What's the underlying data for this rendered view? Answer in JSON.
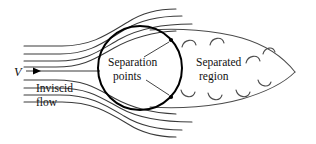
{
  "figure": {
    "width": 316,
    "height": 144,
    "background_color": "#ffffff",
    "line_color": "#3a3a3a",
    "body_color": "#000000",
    "text_color": "#111111"
  },
  "labels": {
    "velocity": "V",
    "inviscid_flow_line1": "Inviscid",
    "inviscid_flow_line2": "flow",
    "separation_points_line1": "Separation",
    "separation_points_line2": "points",
    "separated_region_line1": "Separated",
    "separated_region_line2": "region"
  },
  "diagram_data": {
    "type": "diagram",
    "subject": "fluid-dynamics-flow-separation",
    "body": {
      "shape": "circle",
      "center_x": 140,
      "center_y": 68,
      "radius": 42
    },
    "separation_points": [
      {
        "x": 171,
        "y": 40
      },
      {
        "x": 171,
        "y": 97
      }
    ],
    "wake": {
      "shape": "teardrop",
      "tip_x": 295,
      "tip_y": 72,
      "eddy_count": 8
    },
    "streamlines": {
      "upper_count": 4,
      "lower_count": 4,
      "centerline_count": 1
    },
    "flow_direction": "left-to-right"
  }
}
